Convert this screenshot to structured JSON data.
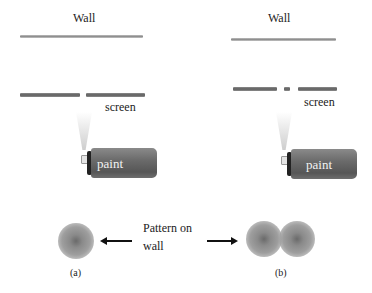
{
  "panel_a": {
    "wall_label": "Wall",
    "screen_label": "screen",
    "can_label": "paint",
    "caption": "(a)",
    "slits": 1,
    "spots": 1
  },
  "panel_b": {
    "wall_label": "Wall",
    "screen_label": "screen",
    "can_label": "paint",
    "caption": "(b)",
    "slits": 2,
    "spots": 2
  },
  "center": {
    "pattern_line1": "Pattern  on",
    "pattern_line2": "wall"
  },
  "colors": {
    "wall": "#a8a8a8",
    "screen": "#6e6e6e",
    "can_body": "#666666",
    "pattern": "#8a8a8a",
    "arrow": "#111111"
  }
}
